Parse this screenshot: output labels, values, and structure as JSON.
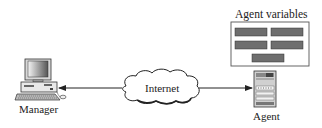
{
  "diagram": {
    "type": "network-management",
    "nodes": {
      "manager": {
        "label": "Manager",
        "icon": "desktop-computer-icon"
      },
      "internet": {
        "label": "Internet",
        "icon": "cloud-icon"
      },
      "agent": {
        "label": "Agent",
        "icon": "server-icon"
      },
      "agent_variables": {
        "label": "Agent variables",
        "variable_count": 5
      }
    },
    "edges": [
      {
        "from": "internet",
        "to": "manager",
        "arrow": "end"
      },
      {
        "from": "internet",
        "to": "agent",
        "arrow": "end"
      }
    ],
    "colors": {
      "line": "#222222",
      "variable_fill": "#6e6e6e",
      "box_border": "#555555"
    }
  }
}
